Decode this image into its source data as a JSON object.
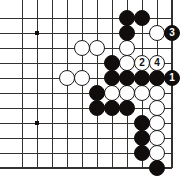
{
  "diagram": {
    "kind": "go-board-diagram",
    "game": "Go",
    "title": "",
    "board": {
      "columns": 11,
      "rows": 11,
      "origin_x": 22,
      "origin_y": 18,
      "spacing": 15,
      "stone_radius": 8.2,
      "line_color": "#33302e",
      "edge_color": "#33302e",
      "background_color": "#ffffff",
      "star_point_color": "#100d0c",
      "shows_right_edge": true,
      "shows_bottom_edge": true,
      "shows_top_edge": false,
      "shows_left_edge": false
    },
    "star_points": [
      {
        "col": 1,
        "row": 1
      },
      {
        "col": 1,
        "row": 7
      }
    ],
    "black_stones": [
      {
        "col": 7,
        "row": 0
      },
      {
        "col": 8,
        "row": 0
      },
      {
        "col": 7,
        "row": 1
      },
      {
        "col": 6,
        "row": 3
      },
      {
        "col": 6,
        "row": 4
      },
      {
        "col": 7,
        "row": 4
      },
      {
        "col": 8,
        "row": 4
      },
      {
        "col": 9,
        "row": 4
      },
      {
        "col": 5,
        "row": 5
      },
      {
        "col": 5,
        "row": 6
      },
      {
        "col": 6,
        "row": 6
      },
      {
        "col": 7,
        "row": 6
      },
      {
        "col": 8,
        "row": 7
      },
      {
        "col": 8,
        "row": 8
      },
      {
        "col": 8,
        "row": 9
      },
      {
        "col": 9,
        "row": 10
      }
    ],
    "white_stones": [
      {
        "col": 9,
        "row": 1
      },
      {
        "col": 4,
        "row": 2
      },
      {
        "col": 5,
        "row": 2
      },
      {
        "col": 7,
        "row": 2
      },
      {
        "col": 7,
        "row": 3
      },
      {
        "col": 3,
        "row": 4
      },
      {
        "col": 4,
        "row": 4
      },
      {
        "col": 6,
        "row": 5
      },
      {
        "col": 7,
        "row": 5
      },
      {
        "col": 8,
        "row": 5
      },
      {
        "col": 9,
        "row": 5
      },
      {
        "col": 9,
        "row": 6
      },
      {
        "col": 9,
        "row": 7
      },
      {
        "col": 9,
        "row": 8
      },
      {
        "col": 9,
        "row": 9
      }
    ],
    "numbered_moves": [
      {
        "number": 1,
        "label": "1",
        "color": "black",
        "col": 10,
        "row": 4
      },
      {
        "number": 2,
        "label": "2",
        "color": "white",
        "col": 8,
        "row": 3
      },
      {
        "number": 3,
        "label": "3",
        "color": "black",
        "col": 10,
        "row": 1
      },
      {
        "number": 4,
        "label": "4",
        "color": "white",
        "col": 9,
        "row": 3
      }
    ]
  }
}
